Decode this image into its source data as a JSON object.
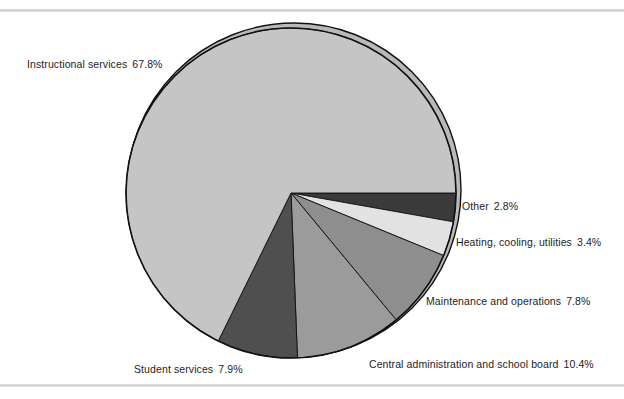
{
  "chart_data": {
    "type": "pie",
    "title": "",
    "subtitle": "",
    "xlabel": "",
    "ylabel": "",
    "legend_position": "callout-labels",
    "grid": false,
    "unit": "%",
    "start_angle_deg": 0,
    "direction": "clockwise",
    "center": {
      "x": 291,
      "y": 193
    },
    "radius": 165,
    "categories": [
      "Other",
      "Heating, cooling, utilities",
      "Maintenance and operations",
      "Central administration and school board",
      "Student services",
      "Instructional services"
    ],
    "values": [
      2.8,
      3.4,
      7.8,
      10.4,
      7.9,
      67.8
    ],
    "slices": [
      {
        "label": "Other",
        "value": 2.8,
        "value_text": "2.8%",
        "color": "#3a3a3a"
      },
      {
        "label": "Heating, cooling, utilities",
        "value": 3.4,
        "value_text": "3.4%",
        "color": "#e2e2e2"
      },
      {
        "label": "Maintenance and operations",
        "value": 7.8,
        "value_text": "7.8%",
        "color": "#8e8e8e"
      },
      {
        "label": "Central administration and school board",
        "value": 10.4,
        "value_text": "10.4%",
        "color": "#9b9b9b"
      },
      {
        "label": "Student services",
        "value": 7.9,
        "value_text": "7.9%",
        "color": "#4f4f4f"
      },
      {
        "label": "Instructional services",
        "value": 67.8,
        "value_text": "67.8%",
        "color": "#c5c5c5"
      }
    ]
  },
  "labels": {
    "instructional": {
      "name": "Instructional services",
      "value": "67.8%"
    },
    "student": {
      "name": "Student services",
      "value": "7.9%"
    },
    "central": {
      "name": "Central administration and school board",
      "value": "10.4%"
    },
    "maintenance": {
      "name": "Maintenance and operations",
      "value": "7.8%"
    },
    "heating": {
      "name": "Heating, cooling, utilities",
      "value": "3.4%"
    },
    "other": {
      "name": "Other",
      "value": "2.8%"
    }
  },
  "style": {
    "background": "#ffffff",
    "rule_color": "#c9c9c9",
    "outline_color": "#111111",
    "text_color": "#1d1d1d"
  }
}
